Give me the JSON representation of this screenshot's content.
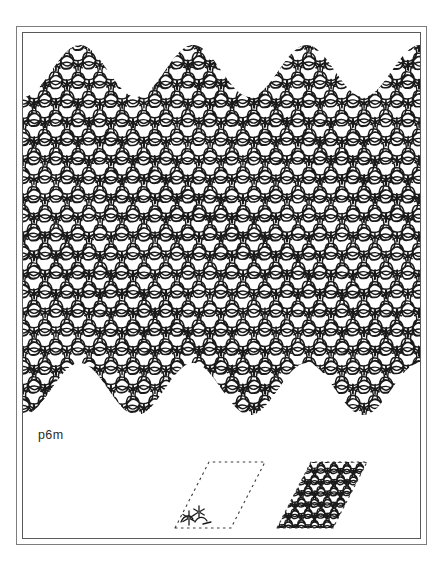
{
  "document": {
    "kind": "figure-plate",
    "background_color": "#ffffff",
    "ink_color": "#1a1a1a"
  },
  "frame": {
    "style": "double-rule-rectangle",
    "outer_color": "#7d7d7d",
    "inner_color": "#5a5a5a",
    "outer_width_px": 1,
    "inner_width_px": 1
  },
  "figure": {
    "caption": "p6m",
    "caption_meaning": "wallpaper group p6m",
    "pattern_name": "hexagonal packing of circles and rounded pentagons",
    "lattice": "hexagonal",
    "edge_style": "scalloped top and bottom, straight left and right",
    "stroke_color": "#1a1a1a"
  },
  "unit_cells": [
    {
      "label": "fundamental-domain-cell",
      "outline": "dashed",
      "outline_color": "#3a3a3a",
      "fill": "empty",
      "motif_position": "bottom-left corner",
      "shape": "rhombus",
      "interior_angle_deg": 60
    },
    {
      "label": "filled-unit-cell",
      "outline": "dashed",
      "outline_color": "#3a3a3a",
      "fill": "full-pattern-tile",
      "shape": "rhombus",
      "interior_angle_deg": 60
    }
  ],
  "colors": {
    "paper": "#ffffff",
    "ink": "#1a1a1a",
    "rule_outer": "#7d7d7d",
    "rule_inner": "#5a5a5a",
    "caption": "#2b2b2b"
  },
  "geometry": {
    "canvas_width": 443,
    "canvas_height": 574,
    "pattern_top": 45,
    "pattern_bottom": 415,
    "pattern_left": 28,
    "pattern_right": 412,
    "cell_spacing_px": 22
  }
}
